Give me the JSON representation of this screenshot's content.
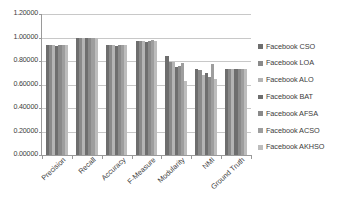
{
  "chart_data": {
    "type": "bar",
    "title": "",
    "xlabel": "",
    "ylabel": "",
    "ylim": [
      0,
      1.2
    ],
    "ytick_labels": [
      "0.00000",
      "0.20000",
      "0.40000",
      "0.60000",
      "0.80000",
      "1.00000",
      "1.20000"
    ],
    "ytick_values": [
      0,
      0.2,
      0.4,
      0.6,
      0.8,
      1.0,
      1.2
    ],
    "grid": true,
    "legend_position": "right",
    "categories": [
      "Precision",
      "Recall",
      "Accuracy",
      "F-Measure",
      "Modularity",
      "NMI",
      "Ground Truth"
    ],
    "series": [
      {
        "name": "Facebook CSO",
        "color": "#6e6e6e",
        "values": [
          0.94,
          1.0,
          0.938,
          0.968,
          0.843,
          0.733,
          0.729
        ]
      },
      {
        "name": "Facebook LOA",
        "color": "#8a8a8a",
        "values": [
          0.94,
          1.0,
          0.938,
          0.968,
          0.792,
          0.727,
          0.729
        ]
      },
      {
        "name": "Facebook ALO",
        "color": "#b4b4b4",
        "values": [
          0.94,
          1.0,
          0.938,
          0.968,
          0.79,
          0.683,
          0.729
        ]
      },
      {
        "name": "Facebook BAT",
        "color": "#6e6e6e",
        "values": [
          0.925,
          1.0,
          0.925,
          0.96,
          0.752,
          0.702,
          0.729
        ]
      },
      {
        "name": "Facebook AFSA",
        "color": "#8a8a8a",
        "values": [
          0.94,
          1.0,
          0.938,
          0.968,
          0.76,
          0.662,
          0.729
        ]
      },
      {
        "name": "Facebook ACSO",
        "color": "#9e9e9e",
        "values": [
          0.94,
          1.0,
          0.938,
          0.975,
          0.779,
          0.772,
          0.729
        ]
      },
      {
        "name": "Facebook AKHSO",
        "color": "#bdbdbd",
        "values": [
          0.94,
          1.0,
          0.938,
          0.968,
          0.629,
          0.651,
          0.729
        ]
      }
    ]
  },
  "legend": {
    "items": [
      {
        "label": "Facebook CSO"
      },
      {
        "label": "Facebook LOA"
      },
      {
        "label": "Facebook ALO"
      },
      {
        "label": "Facebook BAT"
      },
      {
        "label": "Facebook AFSA"
      },
      {
        "label": "Facebook ACSO"
      },
      {
        "label": "Facebook AKHSO"
      }
    ]
  }
}
